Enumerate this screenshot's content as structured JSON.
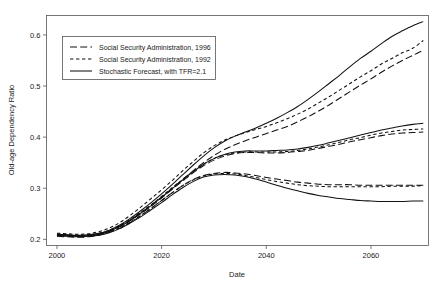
{
  "chart_data": {
    "type": "line",
    "title": "",
    "xlabel": "Date",
    "ylabel": "Old-age Dependency Ratio",
    "xlim": [
      1998,
      2071
    ],
    "ylim": [
      0.188,
      0.638
    ],
    "xticks": [
      2000,
      2020,
      2040,
      2060
    ],
    "yticks": [
      0.2,
      0.3,
      0.4,
      0.5,
      0.6
    ],
    "xtick_labels": [
      "2000",
      "2020",
      "2040",
      "2060"
    ],
    "ytick_labels": [
      "0.2",
      "0.3",
      "0.4",
      "0.5",
      "0.6"
    ],
    "grid": false,
    "legend_position": "upper-left",
    "legend_entries": [
      {
        "label": "Social Security Administration, 1996",
        "style": "long-dash"
      },
      {
        "label": "Social Security Administration, 1992",
        "style": "short-dash"
      },
      {
        "label": "Stochastic Forecast, with TFR=2.1",
        "style": "solid"
      }
    ],
    "x": [
      2000,
      2002,
      2004,
      2006,
      2008,
      2010,
      2012,
      2014,
      2016,
      2018,
      2020,
      2022,
      2024,
      2026,
      2028,
      2030,
      2032,
      2034,
      2036,
      2038,
      2040,
      2042,
      2044,
      2046,
      2048,
      2050,
      2052,
      2054,
      2056,
      2058,
      2060,
      2062,
      2064,
      2066,
      2068,
      2070
    ],
    "series": [
      {
        "name": "Stochastic Forecast, with TFR=2.1 — upper",
        "style": "solid",
        "band": "upper",
        "values": [
          0.21,
          0.209,
          0.208,
          0.209,
          0.212,
          0.218,
          0.228,
          0.241,
          0.256,
          0.272,
          0.289,
          0.307,
          0.326,
          0.345,
          0.363,
          0.379,
          0.392,
          0.402,
          0.41,
          0.418,
          0.427,
          0.437,
          0.448,
          0.46,
          0.474,
          0.489,
          0.505,
          0.521,
          0.538,
          0.554,
          0.568,
          0.583,
          0.597,
          0.608,
          0.618,
          0.626
        ]
      },
      {
        "name": "Social Security Administration, 1992 — upper",
        "style": "short-dash",
        "band": "upper",
        "values": [
          0.212,
          0.211,
          0.21,
          0.211,
          0.215,
          0.222,
          0.233,
          0.247,
          0.263,
          0.28,
          0.297,
          0.315,
          0.334,
          0.352,
          0.369,
          0.383,
          0.394,
          0.402,
          0.409,
          0.415,
          0.421,
          0.428,
          0.436,
          0.445,
          0.455,
          0.467,
          0.479,
          0.492,
          0.505,
          0.518,
          0.53,
          0.543,
          0.554,
          0.565,
          0.574,
          0.589
        ]
      },
      {
        "name": "Social Security Administration, 1996 — upper",
        "style": "long-dash",
        "band": "upper",
        "values": [
          0.209,
          0.208,
          0.207,
          0.208,
          0.211,
          0.217,
          0.226,
          0.238,
          0.252,
          0.267,
          0.283,
          0.3,
          0.317,
          0.334,
          0.35,
          0.364,
          0.376,
          0.385,
          0.393,
          0.4,
          0.407,
          0.414,
          0.421,
          0.43,
          0.44,
          0.451,
          0.463,
          0.476,
          0.489,
          0.502,
          0.514,
          0.527,
          0.539,
          0.55,
          0.56,
          0.57
        ]
      },
      {
        "name": "Stochastic Forecast, with TFR=2.1 — middle",
        "style": "solid",
        "band": "middle",
        "values": [
          0.209,
          0.208,
          0.207,
          0.208,
          0.21,
          0.216,
          0.225,
          0.237,
          0.251,
          0.266,
          0.282,
          0.299,
          0.316,
          0.332,
          0.347,
          0.358,
          0.366,
          0.371,
          0.373,
          0.373,
          0.373,
          0.374,
          0.375,
          0.377,
          0.38,
          0.384,
          0.389,
          0.394,
          0.399,
          0.404,
          0.409,
          0.414,
          0.418,
          0.422,
          0.425,
          0.427
        ]
      },
      {
        "name": "Social Security Administration, 1992 — middle",
        "style": "short-dash",
        "band": "middle",
        "values": [
          0.21,
          0.209,
          0.208,
          0.209,
          0.212,
          0.218,
          0.227,
          0.239,
          0.253,
          0.268,
          0.284,
          0.301,
          0.317,
          0.333,
          0.347,
          0.358,
          0.365,
          0.369,
          0.371,
          0.371,
          0.371,
          0.371,
          0.372,
          0.374,
          0.377,
          0.381,
          0.385,
          0.39,
          0.395,
          0.399,
          0.404,
          0.408,
          0.411,
          0.414,
          0.415,
          0.416
        ]
      },
      {
        "name": "Social Security Administration, 1996 — middle",
        "style": "long-dash",
        "band": "middle",
        "values": [
          0.208,
          0.207,
          0.206,
          0.207,
          0.21,
          0.216,
          0.225,
          0.237,
          0.25,
          0.265,
          0.281,
          0.298,
          0.314,
          0.33,
          0.344,
          0.355,
          0.363,
          0.368,
          0.37,
          0.37,
          0.369,
          0.369,
          0.37,
          0.372,
          0.374,
          0.378,
          0.382,
          0.386,
          0.391,
          0.395,
          0.399,
          0.403,
          0.406,
          0.408,
          0.409,
          0.41
        ]
      },
      {
        "name": "Stochastic Forecast, with TFR=2.1 — lower",
        "style": "solid",
        "band": "lower",
        "values": [
          0.207,
          0.206,
          0.205,
          0.206,
          0.208,
          0.213,
          0.221,
          0.232,
          0.244,
          0.258,
          0.272,
          0.287,
          0.301,
          0.313,
          0.322,
          0.326,
          0.327,
          0.326,
          0.323,
          0.318,
          0.312,
          0.306,
          0.3,
          0.295,
          0.29,
          0.286,
          0.283,
          0.28,
          0.278,
          0.276,
          0.275,
          0.274,
          0.274,
          0.274,
          0.275,
          0.275
        ]
      },
      {
        "name": "Social Security Administration, 1992 — lower",
        "style": "short-dash",
        "band": "lower",
        "values": [
          0.208,
          0.207,
          0.206,
          0.207,
          0.209,
          0.215,
          0.223,
          0.234,
          0.247,
          0.261,
          0.276,
          0.291,
          0.305,
          0.316,
          0.324,
          0.328,
          0.329,
          0.328,
          0.325,
          0.321,
          0.317,
          0.313,
          0.31,
          0.307,
          0.305,
          0.304,
          0.303,
          0.303,
          0.303,
          0.303,
          0.303,
          0.303,
          0.304,
          0.304,
          0.304,
          0.305
        ]
      },
      {
        "name": "Social Security Administration, 1996 — lower",
        "style": "long-dash",
        "band": "lower",
        "values": [
          0.206,
          0.205,
          0.204,
          0.205,
          0.208,
          0.214,
          0.222,
          0.233,
          0.246,
          0.261,
          0.276,
          0.291,
          0.305,
          0.317,
          0.325,
          0.329,
          0.331,
          0.33,
          0.328,
          0.325,
          0.321,
          0.318,
          0.315,
          0.312,
          0.31,
          0.308,
          0.307,
          0.307,
          0.307,
          0.306,
          0.306,
          0.306,
          0.306,
          0.306,
          0.306,
          0.306
        ]
      }
    ]
  }
}
